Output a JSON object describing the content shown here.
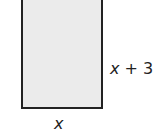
{
  "diagram": {
    "shape": "rectangle",
    "fill_color": "#ebebeb",
    "stroke_color": "#222222",
    "labels": {
      "height": "x + 3",
      "width": "x"
    }
  }
}
